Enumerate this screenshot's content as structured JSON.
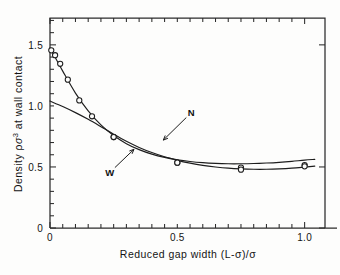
{
  "chart_data": {
    "type": "line",
    "title": "",
    "xlabel": "Reduced gap width  (L-σ)/σ",
    "ylabel": "Density ρσ³ at wall contact",
    "xlim": [
      0,
      1.08
    ],
    "ylim": [
      0,
      1.72
    ],
    "xticks": [
      0,
      0.5,
      1.0
    ],
    "xtick_labels": [
      "0",
      "0.5",
      "1.0"
    ],
    "yticks": [
      0,
      0.5,
      1.0,
      1.5
    ],
    "ytick_labels": [
      "0",
      "0.5",
      "1.0",
      "1.5"
    ],
    "grid": false,
    "legend": "inline-annotations",
    "marker": "open-circle",
    "series": [
      {
        "name": "N",
        "label": "N",
        "annotation": "N",
        "x": [
          0.005,
          0.02,
          0.04,
          0.07,
          0.115,
          0.165,
          0.25,
          0.5,
          0.75,
          1.0
        ],
        "values": [
          1.455,
          1.415,
          1.345,
          1.215,
          1.045,
          0.915,
          0.745,
          0.535,
          0.495,
          0.515
        ],
        "curve_x": [
          0.0,
          0.05,
          0.1,
          0.15,
          0.2,
          0.25,
          0.3,
          0.35,
          0.4,
          0.45,
          0.5,
          0.55,
          0.6,
          0.65,
          0.7,
          0.75,
          0.8,
          0.85,
          0.9,
          0.95,
          1.0,
          1.04
        ],
        "curve_y": [
          1.475,
          1.285,
          1.105,
          0.96,
          0.845,
          0.757,
          0.691,
          0.642,
          0.605,
          0.578,
          0.559,
          0.545,
          0.535,
          0.529,
          0.526,
          0.526,
          0.528,
          0.532,
          0.538,
          0.546,
          0.556,
          0.562
        ]
      },
      {
        "name": "W",
        "label": "W",
        "annotation": "W",
        "x": [
          0.25,
          0.5,
          0.75,
          1.0
        ],
        "values": [
          0.745,
          0.535,
          0.478,
          0.505
        ],
        "curve_x": [
          0.0,
          0.05,
          0.1,
          0.15,
          0.2,
          0.25,
          0.3,
          0.35,
          0.4,
          0.45,
          0.5,
          0.55,
          0.6,
          0.65,
          0.7,
          0.75,
          0.8,
          0.85,
          0.9,
          0.95,
          1.0,
          1.04
        ],
        "curve_y": [
          1.04,
          0.995,
          0.945,
          0.89,
          0.83,
          0.768,
          0.71,
          0.66,
          0.618,
          0.583,
          0.554,
          0.531,
          0.513,
          0.5,
          0.49,
          0.484,
          0.481,
          0.481,
          0.484,
          0.49,
          0.499,
          0.507
        ]
      }
    ],
    "annotations": [
      {
        "text": "N",
        "at_x": 0.555,
        "at_y": 0.945,
        "points_to_x": 0.445,
        "points_to_y": 0.72
      },
      {
        "text": "W",
        "at_x": 0.235,
        "at_y": 0.455,
        "points_to_x": 0.33,
        "points_to_y": 0.645
      }
    ]
  }
}
